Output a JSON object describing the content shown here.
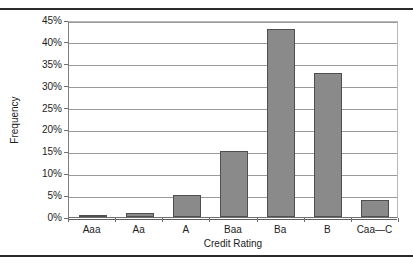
{
  "chart_data": {
    "type": "bar",
    "title": "",
    "xlabel": "Credit Rating",
    "ylabel": "Frequency",
    "categories": [
      "Aaa",
      "Aa",
      "A",
      "Baa",
      "Ba",
      "B",
      "Caa—C"
    ],
    "values": [
      0.5,
      1,
      5,
      15,
      43,
      33,
      4
    ],
    "ylim": [
      0,
      45
    ],
    "yticks": [
      0,
      5,
      10,
      15,
      20,
      25,
      30,
      35,
      40,
      45
    ],
    "ytick_labels": [
      "0%",
      "5%",
      "10%",
      "15%",
      "20%",
      "25%",
      "30%",
      "35%",
      "40%",
      "45%"
    ],
    "grid": "horizontal",
    "legend": "none",
    "bar_color": "#8a8a8a",
    "bar_border_color": "#4f4f4f",
    "gridline_color": "#9a9a9a",
    "plot_background": "#ffffff"
  }
}
